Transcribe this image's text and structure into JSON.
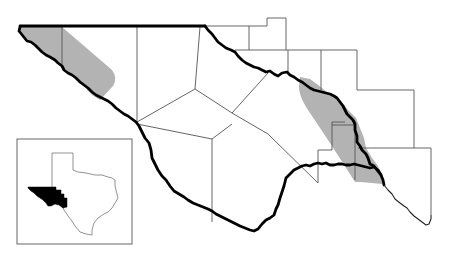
{
  "map": {
    "subject": "Trans-Pecos Texas counties with shaded range distribution",
    "colors": {
      "background": "#ffffff",
      "range_fill": "#b3b3b3",
      "county_line": "#555555",
      "border_line": "#000000",
      "inset_highlight": "#000000"
    },
    "layers": [
      {
        "name": "county-boundaries",
        "style": "thin gray lines"
      },
      {
        "name": "state-and-river-border",
        "style": "thick black line"
      },
      {
        "name": "distribution-range",
        "style": "gray fill",
        "regions": [
          "northwest-range",
          "southeast-range"
        ]
      }
    ],
    "inset": {
      "subject": "State of Texas locator",
      "highlighted_region": "Trans-Pecos (west Texas)"
    }
  }
}
